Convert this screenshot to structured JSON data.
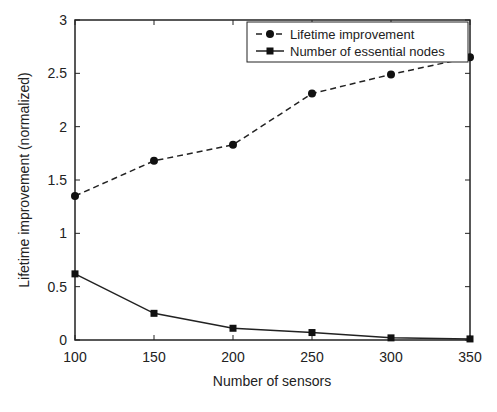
{
  "chart_data": {
    "type": "line",
    "title": "",
    "xlabel": "Number of sensors",
    "ylabel": "Lifetime improvement (normalized)",
    "x": [
      100,
      150,
      200,
      250,
      300,
      350
    ],
    "xlim": [
      100,
      350
    ],
    "ylim": [
      0,
      3
    ],
    "xticks": [
      "100",
      "150",
      "200",
      "250",
      "300",
      "350"
    ],
    "yticks": [
      "0",
      "0.5",
      "1",
      "1.5",
      "2",
      "2.5",
      "3"
    ],
    "grid": false,
    "legend_position": "top-right",
    "series": [
      {
        "name": "Lifetime improvement",
        "style": "dashed",
        "marker": "circle",
        "values": [
          1.35,
          1.68,
          1.83,
          2.31,
          2.49,
          2.65
        ]
      },
      {
        "name": "Number of essential nodes",
        "style": "solid",
        "marker": "square",
        "values": [
          0.62,
          0.25,
          0.11,
          0.07,
          0.02,
          0.01
        ]
      }
    ]
  }
}
